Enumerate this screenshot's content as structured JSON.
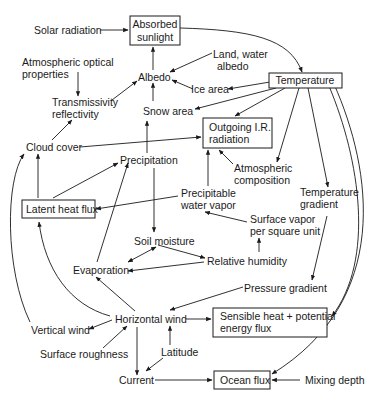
{
  "diagram": {
    "type": "climate feedback flow diagram",
    "nodes": {
      "solar_radiation": {
        "label": [
          "Solar radiation"
        ],
        "boxed": false
      },
      "absorbed_sunlight": {
        "label": [
          "Absorbed",
          "sunlight"
        ],
        "boxed": true
      },
      "land_water_albedo": {
        "label": [
          "Land, water",
          "albedo"
        ],
        "boxed": false
      },
      "atmospheric_optical_properties": {
        "label": [
          "Atmospheric optical",
          "properties"
        ],
        "boxed": false
      },
      "albedo": {
        "label": [
          "Albedo"
        ],
        "boxed": false
      },
      "ice_area": {
        "label": [
          "Ice area"
        ],
        "boxed": false
      },
      "temperature": {
        "label": [
          "Temperature"
        ],
        "boxed": true
      },
      "transmissivity_reflectivity": {
        "label": [
          "Transmissivity",
          "reflectivity"
        ],
        "boxed": false
      },
      "snow_area": {
        "label": [
          "Snow area"
        ],
        "boxed": false
      },
      "cloud_cover": {
        "label": [
          "Cloud cover"
        ],
        "boxed": false
      },
      "outgoing_ir_radiation": {
        "label": [
          "Outgoing I.R.",
          "radiation"
        ],
        "boxed": true
      },
      "precipitation": {
        "label": [
          "Precipitation"
        ],
        "boxed": false
      },
      "atmospheric_composition": {
        "label": [
          "Atmospheric",
          "composition"
        ],
        "boxed": false
      },
      "temperature_gradient": {
        "label": [
          "Temperature",
          "gradient"
        ],
        "boxed": false
      },
      "latent_heat_flux": {
        "label": [
          "Latent heat flux"
        ],
        "boxed": true
      },
      "precipitable_water_vapor": {
        "label": [
          "Precipitable",
          "water vapor"
        ],
        "boxed": false
      },
      "surface_vapor": {
        "label": [
          "Surface vapor",
          "per square unit"
        ],
        "boxed": false
      },
      "soil_moisture": {
        "label": [
          "Soil moisture"
        ],
        "boxed": false
      },
      "evaporation": {
        "label": [
          "Evaporation"
        ],
        "boxed": false
      },
      "relative_humidity": {
        "label": [
          "Relative humidity"
        ],
        "boxed": false
      },
      "pressure_gradient": {
        "label": [
          "Pressure gradient"
        ],
        "boxed": false
      },
      "vertical_wind": {
        "label": [
          "Vertical wind"
        ],
        "boxed": false
      },
      "horizontal_wind": {
        "label": [
          "Horizontal wind"
        ],
        "boxed": false
      },
      "sensible_heat": {
        "label": [
          "Sensible heat + potential",
          "energy flux"
        ],
        "boxed": true
      },
      "surface_roughness": {
        "label": [
          "Surface roughness"
        ],
        "boxed": false
      },
      "latitude": {
        "label": [
          "Latitude"
        ],
        "boxed": false
      },
      "current": {
        "label": [
          "Current"
        ],
        "boxed": false
      },
      "ocean_flux": {
        "label": [
          "Ocean flux"
        ],
        "boxed": true
      },
      "mixing_depth": {
        "label": [
          "Mixing depth"
        ],
        "boxed": false
      }
    },
    "edges": [
      [
        "solar_radiation",
        "absorbed_sunlight"
      ],
      [
        "absorbed_sunlight",
        "temperature"
      ],
      [
        "albedo",
        "absorbed_sunlight"
      ],
      [
        "land_water_albedo",
        "albedo"
      ],
      [
        "temperature",
        "albedo"
      ],
      [
        "ice_area",
        "albedo"
      ],
      [
        "temperature",
        "ice_area"
      ],
      [
        "temperature",
        "snow_area"
      ],
      [
        "snow_area",
        "albedo"
      ],
      [
        "atmospheric_optical_properties",
        "transmissivity_reflectivity"
      ],
      [
        "transmissivity_reflectivity",
        "albedo"
      ],
      [
        "cloud_cover",
        "transmissivity_reflectivity"
      ],
      [
        "cloud_cover",
        "outgoing_ir_radiation"
      ],
      [
        "temperature",
        "outgoing_ir_radiation"
      ],
      [
        "temperature",
        "atmospheric_composition"
      ],
      [
        "atmospheric_composition",
        "outgoing_ir_radiation"
      ],
      [
        "precipitable_water_vapor",
        "outgoing_ir_radiation"
      ],
      [
        "temperature",
        "temperature_gradient"
      ],
      [
        "temperature",
        "sensible_heat"
      ],
      [
        "temperature",
        "ocean_flux"
      ],
      [
        "precipitation",
        "snow_area"
      ],
      [
        "precipitation",
        "soil_moisture"
      ],
      [
        "latent_heat_flux",
        "cloud_cover"
      ],
      [
        "latent_heat_flux",
        "precipitation"
      ],
      [
        "precipitable_water_vapor",
        "latent_heat_flux"
      ],
      [
        "surface_vapor",
        "precipitable_water_vapor"
      ],
      [
        "relative_humidity",
        "surface_vapor"
      ],
      [
        "soil_moisture",
        "evaporation"
      ],
      [
        "evaporation",
        "soil_moisture"
      ],
      [
        "soil_moisture",
        "relative_humidity"
      ],
      [
        "relative_humidity",
        "evaporation"
      ],
      [
        "evaporation",
        "precipitation"
      ],
      [
        "horizontal_wind",
        "latent_heat_flux"
      ],
      [
        "horizontal_wind",
        "evaporation"
      ],
      [
        "vertical_wind",
        "cloud_cover"
      ],
      [
        "horizontal_wind",
        "vertical_wind"
      ],
      [
        "surface_roughness",
        "horizontal_wind"
      ],
      [
        "temperature_gradient",
        "pressure_gradient"
      ],
      [
        "pressure_gradient",
        "horizontal_wind"
      ],
      [
        "horizontal_wind",
        "sensible_heat"
      ],
      [
        "latitude",
        "horizontal_wind"
      ],
      [
        "latitude",
        "current"
      ],
      [
        "horizontal_wind",
        "current"
      ],
      [
        "current",
        "ocean_flux"
      ],
      [
        "mixing_depth",
        "ocean_flux"
      ]
    ]
  }
}
